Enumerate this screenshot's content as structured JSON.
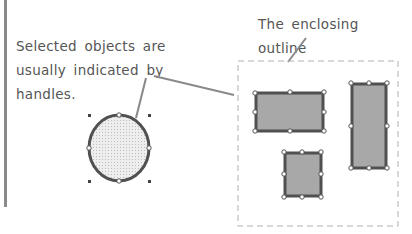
{
  "captions": {
    "selected_objects": "Selected objects are usually indicated by handles.",
    "enclosing_outline": "The enclosing outline"
  },
  "colors": {
    "text": "#555555",
    "outline": "#555555",
    "fill": "#a8a8a8",
    "circle_fill": "#e4e4e4",
    "leader": "#8a8a8a",
    "dashed_box": "#b0b0b0"
  },
  "shapes": [
    {
      "type": "ellipse",
      "label": "circle",
      "cx": 119,
      "cy": 148,
      "rx": 30,
      "ry": 33
    },
    {
      "type": "rect",
      "label": "wide-rectangle",
      "x": 255,
      "y": 93,
      "w": 68,
      "h": 38
    },
    {
      "type": "rect",
      "label": "tall-rectangle",
      "x": 351,
      "y": 83,
      "w": 35,
      "h": 84
    },
    {
      "type": "rect",
      "label": "small-square",
      "x": 284,
      "y": 152,
      "w": 37,
      "h": 44
    }
  ]
}
